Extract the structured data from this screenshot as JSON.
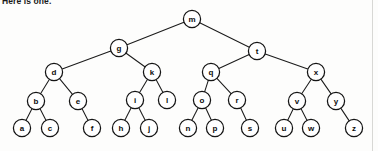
{
  "caption": {
    "text": "Here is one."
  },
  "diagram": {
    "node_radius": 8.6,
    "stroke_color": "#141414",
    "fill_color": "#ffffff",
    "edge_color": "#1b1b1b",
    "background_color": "#fdfdfc",
    "nodes": [
      {
        "id": "m",
        "label": "m",
        "x": 192,
        "y": 19,
        "level": 0
      },
      {
        "id": "g",
        "label": "g",
        "x": 119,
        "y": 48,
        "level": 1
      },
      {
        "id": "t",
        "label": "t",
        "x": 257,
        "y": 51,
        "level": 1
      },
      {
        "id": "d",
        "label": "d",
        "x": 54,
        "y": 72,
        "level": 2
      },
      {
        "id": "k",
        "label": "k",
        "x": 152,
        "y": 72,
        "level": 2
      },
      {
        "id": "q",
        "label": "q",
        "x": 211,
        "y": 72,
        "level": 2
      },
      {
        "id": "x",
        "label": "x",
        "x": 316,
        "y": 72,
        "level": 2
      },
      {
        "id": "b",
        "label": "b",
        "x": 36,
        "y": 101,
        "level": 3
      },
      {
        "id": "e",
        "label": "e",
        "x": 78,
        "y": 101,
        "level": 3
      },
      {
        "id": "i",
        "label": "i",
        "x": 135,
        "y": 100,
        "level": 3
      },
      {
        "id": "l",
        "label": "l",
        "x": 167,
        "y": 100,
        "level": 3
      },
      {
        "id": "o",
        "label": "o",
        "x": 202,
        "y": 100,
        "level": 3
      },
      {
        "id": "r",
        "label": "r",
        "x": 237,
        "y": 100,
        "level": 3
      },
      {
        "id": "v",
        "label": "v",
        "x": 297,
        "y": 101,
        "level": 3
      },
      {
        "id": "y",
        "label": "y",
        "x": 336,
        "y": 101,
        "level": 3
      },
      {
        "id": "a",
        "label": "a",
        "x": 22,
        "y": 128,
        "level": 4
      },
      {
        "id": "c",
        "label": "c",
        "x": 50,
        "y": 128,
        "level": 4
      },
      {
        "id": "f",
        "label": "f",
        "x": 92,
        "y": 128,
        "level": 4
      },
      {
        "id": "h",
        "label": "h",
        "x": 121,
        "y": 128,
        "level": 4
      },
      {
        "id": "j",
        "label": "j",
        "x": 149,
        "y": 128,
        "level": 4
      },
      {
        "id": "n",
        "label": "n",
        "x": 188,
        "y": 128,
        "level": 4
      },
      {
        "id": "p",
        "label": "p",
        "x": 215,
        "y": 128,
        "level": 4
      },
      {
        "id": "s",
        "label": "s",
        "x": 250,
        "y": 128,
        "level": 4
      },
      {
        "id": "u",
        "label": "u",
        "x": 284,
        "y": 128,
        "level": 4
      },
      {
        "id": "w",
        "label": "w",
        "x": 311,
        "y": 128,
        "level": 4
      },
      {
        "id": "z",
        "label": "z",
        "x": 354,
        "y": 128,
        "level": 4
      }
    ],
    "edges": [
      {
        "from": "m",
        "to": "g"
      },
      {
        "from": "m",
        "to": "t"
      },
      {
        "from": "g",
        "to": "d"
      },
      {
        "from": "g",
        "to": "k"
      },
      {
        "from": "t",
        "to": "q"
      },
      {
        "from": "t",
        "to": "x"
      },
      {
        "from": "d",
        "to": "b"
      },
      {
        "from": "d",
        "to": "e"
      },
      {
        "from": "k",
        "to": "i"
      },
      {
        "from": "k",
        "to": "l"
      },
      {
        "from": "q",
        "to": "o"
      },
      {
        "from": "q",
        "to": "r"
      },
      {
        "from": "x",
        "to": "v"
      },
      {
        "from": "x",
        "to": "y"
      },
      {
        "from": "b",
        "to": "a"
      },
      {
        "from": "b",
        "to": "c"
      },
      {
        "from": "e",
        "to": "f"
      },
      {
        "from": "i",
        "to": "h"
      },
      {
        "from": "i",
        "to": "j"
      },
      {
        "from": "o",
        "to": "n"
      },
      {
        "from": "o",
        "to": "p"
      },
      {
        "from": "r",
        "to": "s"
      },
      {
        "from": "v",
        "to": "u"
      },
      {
        "from": "v",
        "to": "w"
      },
      {
        "from": "y",
        "to": "z"
      }
    ]
  }
}
